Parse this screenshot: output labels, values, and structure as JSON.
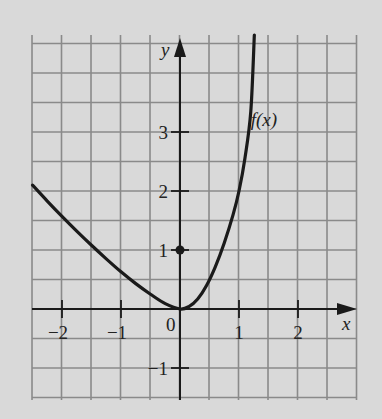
{
  "chart_data": {
    "type": "line",
    "title": "",
    "xlabel": "x",
    "ylabel": "y",
    "xlim": [
      -2.5,
      3.0
    ],
    "ylim": [
      -1.5,
      4.7
    ],
    "grid": true,
    "grid_step": 0.5,
    "x_ticks": [
      -2,
      -1,
      1,
      2
    ],
    "x_tick_labels": [
      "−2",
      "−1",
      "1",
      "2"
    ],
    "y_ticks": [
      -1,
      1,
      2,
      3
    ],
    "y_tick_labels": [
      "−1",
      "1",
      "2",
      "3"
    ],
    "origin_label": "0",
    "series": [
      {
        "name": "f(x)",
        "label": "f(x)",
        "x": [
          -2.5,
          -2.25,
          -2.0,
          -1.75,
          -1.5,
          -1.25,
          -1.0,
          -0.75,
          -0.5,
          -0.25,
          0.0,
          0.15,
          0.3,
          0.45,
          0.6,
          0.75,
          0.9,
          1.0,
          1.1,
          1.2,
          1.26
        ],
        "y": [
          2.1,
          1.83,
          1.57,
          1.32,
          1.08,
          0.85,
          0.63,
          0.43,
          0.25,
          0.09,
          0.0,
          0.04,
          0.17,
          0.4,
          0.72,
          1.12,
          1.6,
          2.0,
          2.55,
          3.35,
          4.7
        ]
      }
    ],
    "points": [
      {
        "x": 0,
        "y": 1,
        "style": "filled-dot"
      }
    ],
    "annotations": [
      {
        "text": "f(x)",
        "x": 1.3,
        "y": 3.2
      }
    ]
  },
  "colors": {
    "background": "#d9d9d9",
    "grid": "#8a8a8a",
    "axis": "#1a1a1a",
    "curve": "#1a1a1a"
  }
}
